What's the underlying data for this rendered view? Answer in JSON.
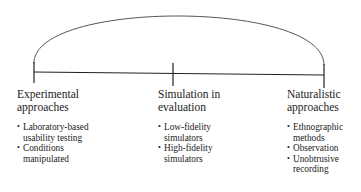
{
  "diagram": {
    "type": "continuum",
    "spectrum": [
      {
        "heading": [
          "Experimental",
          "approaches"
        ],
        "bullets": [
          "Laboratory-based usability testing",
          "Conditions manipulated"
        ]
      },
      {
        "heading": [
          "Simulation in",
          "evaluation"
        ],
        "bullets": [
          "Low-fidelity simulators",
          "High-fidelity simulators"
        ]
      },
      {
        "heading": [
          "Naturalistic",
          "approaches"
        ],
        "bullets": [
          "Ethnographic methods",
          "Observation",
          "Unobtrusive recording"
        ]
      }
    ],
    "colors": {
      "line": "#222222",
      "arc": "#555555",
      "text": "#222222"
    }
  }
}
